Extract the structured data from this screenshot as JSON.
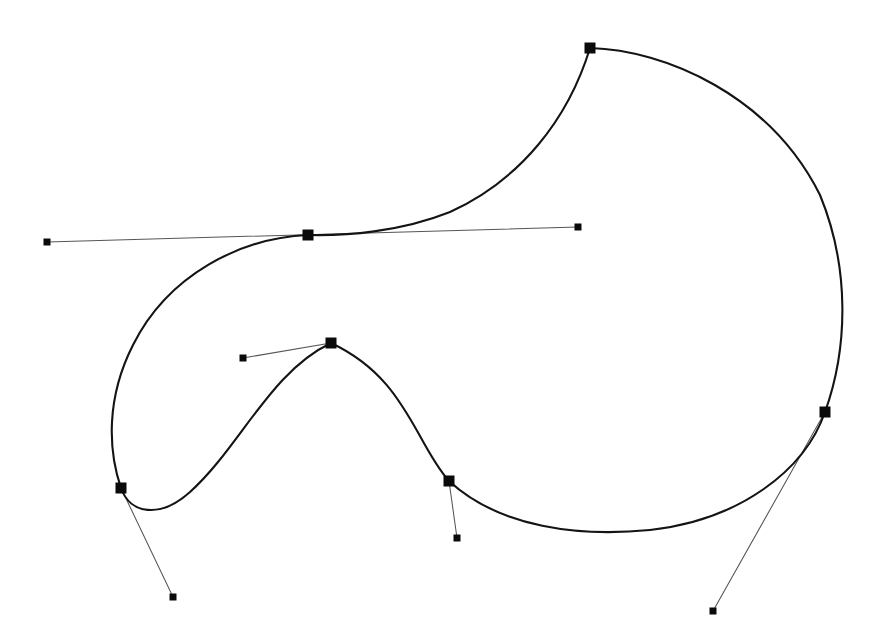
{
  "figure": {
    "name": "bezier-spline-curve-diagram",
    "type": "vector-curve-editor-view",
    "width": 874,
    "height": 644,
    "background_color": "#ffffff",
    "curve_color": "#141414",
    "handle_line_color": "#555555",
    "marker_color": "#0a0a0a",
    "curve_stroke_width": 2.1,
    "handle_stroke_width": 1.05,
    "anchor_marker_size": 11,
    "handle_marker_size": 7
  },
  "chart_data": {
    "type": "scatter",
    "title": "",
    "xlabel": "",
    "ylabel": "",
    "xlim": [
      0,
      874
    ],
    "ylim": [
      0,
      644
    ],
    "grid": false,
    "legend": "none",
    "anchors": [
      {
        "id": "anchor-top",
        "label": "top-cusp",
        "x": 590,
        "y": 48
      },
      {
        "id": "anchor-upper-left",
        "label": "upper-left-saddle",
        "x": 308,
        "y": 235
      },
      {
        "id": "anchor-lower-left",
        "label": "lower-left",
        "x": 121,
        "y": 488
      },
      {
        "id": "anchor-inner-peak",
        "label": "inner-peak",
        "x": 331,
        "y": 343
      },
      {
        "id": "anchor-bottom-mid",
        "label": "bottom-middle",
        "x": 449,
        "y": 481
      },
      {
        "id": "anchor-right",
        "label": "right-side",
        "x": 825,
        "y": 412
      }
    ],
    "handles": [
      {
        "id": "handle-upper-left-in",
        "from_anchor": "anchor-upper-left",
        "x": 47,
        "y": 242
      },
      {
        "id": "handle-upper-left-out",
        "from_anchor": "anchor-upper-left",
        "x": 578,
        "y": 227
      },
      {
        "id": "handle-inner-peak-in",
        "from_anchor": "anchor-inner-peak",
        "x": 243,
        "y": 358
      },
      {
        "id": "handle-lower-left-out",
        "from_anchor": "anchor-lower-left",
        "x": 173,
        "y": 597
      },
      {
        "id": "handle-bottom-mid-out",
        "from_anchor": "anchor-bottom-mid",
        "x": 457,
        "y": 538
      },
      {
        "id": "handle-right-out",
        "from_anchor": "anchor-right",
        "x": 713,
        "y": 611
      }
    ],
    "handle_segments": [
      {
        "id": "handle-seg-upper-left",
        "x1": 47,
        "y1": 242,
        "x2": 578,
        "y2": 227
      },
      {
        "id": "handle-seg-inner-peak",
        "x1": 243,
        "y1": 358,
        "x2": 331,
        "y2": 343
      },
      {
        "id": "handle-seg-lower-left",
        "x1": 121,
        "y1": 488,
        "x2": 173,
        "y2": 597
      },
      {
        "id": "handle-seg-bottom-mid",
        "x1": 449,
        "y1": 481,
        "x2": 457,
        "y2": 538
      },
      {
        "id": "handle-seg-right",
        "x1": 825,
        "y1": 412,
        "x2": 713,
        "y2": 611
      }
    ],
    "curve_segments": [
      {
        "id": "seg-top-to-upperleft",
        "from": "anchor-top",
        "to": "anchor-upper-left",
        "path": "M 590 48 C 568 120 520 180 450 212 C 400 232 345 236 308 235"
      },
      {
        "id": "seg-upperleft-to-lowerleft",
        "from": "anchor-upper-left",
        "to": "anchor-lower-left",
        "path": "M 308 235 C 240 238 168 275 133 345 C 106 398 108 450 121 488"
      },
      {
        "id": "seg-lowerleft-to-innerpeak",
        "from": "anchor-lower-left",
        "to": "anchor-inner-peak",
        "path": "M 121 488 C 130 514 160 519 190 492 C 240 447 270 372 331 343"
      },
      {
        "id": "seg-innerpeak-to-bottommid",
        "from": "anchor-inner-peak",
        "to": "anchor-bottom-mid",
        "path": "M 331 343 C 380 366 400 400 420 436 C 432 458 441 472 449 481"
      },
      {
        "id": "seg-bottommid-to-right",
        "from": "anchor-bottom-mid",
        "to": "anchor-right",
        "path": "M 449 481 C 500 528 580 537 650 530 C 740 520 805 470 825 412"
      },
      {
        "id": "seg-right-to-top",
        "from": "anchor-right",
        "to": "anchor-top",
        "path": "M 825 412 C 848 348 850 268 820 195 C 770 95 665 50 590 48"
      }
    ],
    "extremes": {
      "leftmost_curve_x": 110,
      "rightmost_curve_x": 849,
      "topmost_curve_y": 48,
      "bottommost_curve_y": 536
    }
  }
}
